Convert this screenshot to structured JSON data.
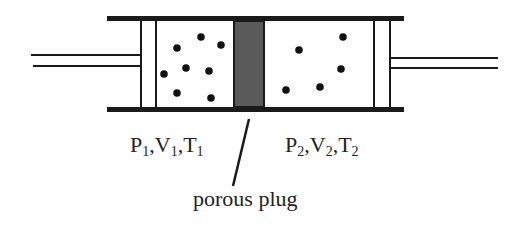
{
  "diagram": {
    "colors": {
      "stroke": "#1a1a1a",
      "plug_fill": "#555555",
      "dot": "#111111",
      "background": "#ffffff"
    },
    "left_state": {
      "P": "P",
      "P_sub": "1",
      "V": "V",
      "V_sub": "1",
      "T": "T",
      "T_sub": "1"
    },
    "right_state": {
      "P": "P",
      "P_sub": "2",
      "V": "V",
      "V_sub": "2",
      "T": "T",
      "T_sub": "2"
    },
    "plug_label": "porous plug",
    "left_molecules": 8,
    "right_molecules": 5
  }
}
